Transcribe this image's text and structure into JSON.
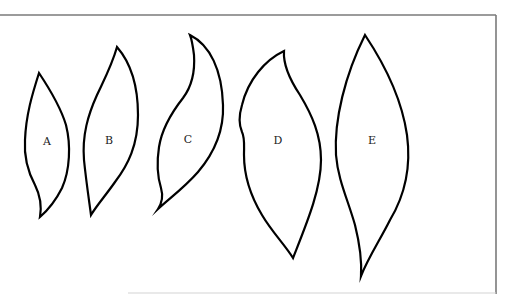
{
  "figure": {
    "frame_color": "#7a7a7a",
    "stroke_color": "#000000",
    "shapes": [
      {
        "label": "A",
        "label_pos": [
          47,
          142
        ],
        "path": "M39,73 C47,85 60,105 66,125 C71,145 70,170 62,188 C56,200 48,210 40,217 C42,205 40,195 35,185 C27,170 24,155 25,140 C26,115 32,95 39,73 Z"
      },
      {
        "label": "B",
        "label_pos": [
          109,
          141
        ],
        "path": "M117,47 C130,62 138,85 138,115 C138,145 128,165 115,182 C106,195 97,205 91,215 C89,200 86,180 84,160 C82,135 88,115 97,95 C104,80 112,65 117,47 Z"
      },
      {
        "label": "C",
        "label_pos": [
          188,
          140
        ],
        "path": "M190,35 C210,45 222,70 223,105 C224,130 215,152 198,172 C185,187 170,198 158,209 C162,203 163,195 161,188 C157,175 157,160 159,147 C162,128 172,112 183,98 C192,86 195,70 194,55 C193,47 192,40 190,35 Z"
      },
      {
        "label": "D",
        "label_pos": [
          278,
          141
        ],
        "path": "M284,51 C283,65 290,80 300,95 C312,115 321,135 321,160 C321,190 306,225 293,258 C285,245 272,232 262,215 C250,195 244,175 244,155 C244,145 245,138 242,132 C239,125 239,115 242,105 C248,80 265,60 284,51 Z"
      },
      {
        "label": "E",
        "label_pos": [
          372,
          141
        ],
        "path": "M365,35 C385,65 402,100 407,135 C411,165 405,195 390,220 C380,240 368,258 361,276 C362,260 360,245 355,225 C348,200 338,180 336,155 C334,120 345,75 365,35 Z"
      }
    ]
  }
}
